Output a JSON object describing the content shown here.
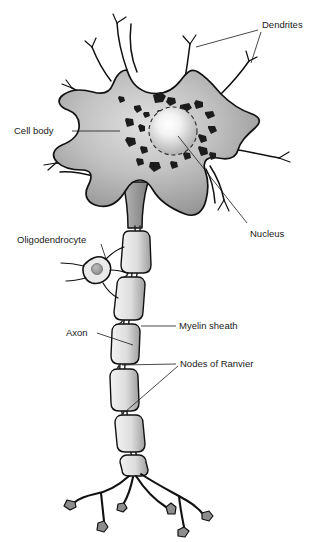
{
  "diagram": {
    "background_color": "#ffffff",
    "line_color": "#111111",
    "soma_fill_light": "#d9d9d9",
    "soma_fill_dark": "#8a8a8a",
    "organelle_color": "#1c1c1c",
    "myelin_fill": "#e3e3e3",
    "myelin_shade": "#a8a8a8",
    "bouton_fill": "#8d8d8d"
  },
  "labels": {
    "dendrites": "Dendrites",
    "cell_body": "Cell body",
    "nucleus": "Nucleus",
    "oligodendrocyte": "Oligodendrocyte",
    "myelin_sheath": "Myelin sheath",
    "axon": "Axon",
    "nodes_of_ranvier": "Nodes of Ranvier"
  },
  "parts": {
    "soma": "cell-body",
    "nucleus": "nucleus",
    "dendrite_count": 7,
    "myelin_segment_count": 6,
    "node_count": 2,
    "terminal_count": 6
  }
}
